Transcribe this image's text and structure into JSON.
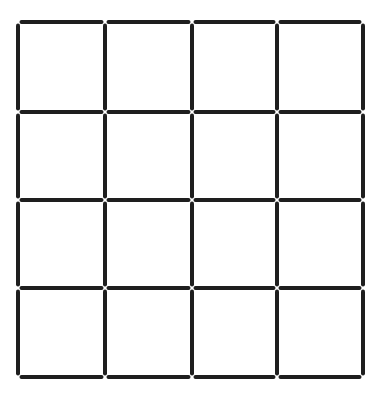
{
  "grid": {
    "rows": 4,
    "columns": 4,
    "x_lines": [
      18,
      105,
      192,
      277,
      363
    ],
    "y_lines": [
      22,
      112,
      200,
      288,
      377
    ],
    "line_color": "#1e1e1e",
    "line_width": 4,
    "gap": 3.5,
    "background": "#ffffff"
  }
}
